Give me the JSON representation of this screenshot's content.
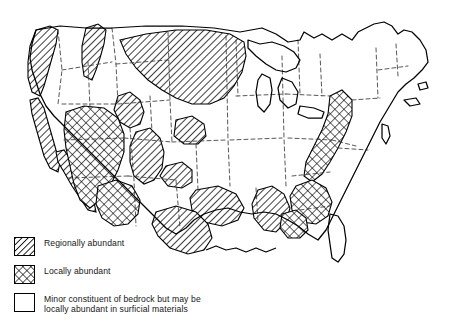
{
  "figure": {
    "kind": "thematic-map",
    "region": "Contiguous United States"
  },
  "legend": {
    "items": [
      {
        "pattern": "diagonal-hatch",
        "label": "Regionally abundant",
        "swatch_name": "legend-swatch-regionally-abundant"
      },
      {
        "pattern": "cross-hatch",
        "label": "Locally abundant",
        "swatch_name": "legend-swatch-locally-abundant"
      },
      {
        "pattern": "blank",
        "label": "Minor constituent of bedrock but may be\nlocally abundant in surficial materials",
        "swatch_name": "legend-swatch-minor-constituent"
      }
    ]
  },
  "colors": {
    "ink": "#000000",
    "background": "#ffffff",
    "state_border": "#3a3a3a",
    "label_text": "#161616"
  },
  "map_regions": {
    "regionally_abundant": [
      "Pacific Northwest / Cascades",
      "Northern Rockies (Idaho, Montana)",
      "Northern Great Plains (Montana, Dakotas, Wyoming)",
      "California Coast Ranges",
      "Colorado Rockies",
      "Central Plains (Kansas, Nebraska patches)",
      "Ozark / Arkansas",
      "Texas Hill Country and Gulf Coastal Plain",
      "Mississippi Embayment"
    ],
    "locally_abundant": [
      "Great Basin (Nevada, Utah)",
      "Arizona / New Mexico Highlands",
      "Appalachian Belt",
      "Southern Piedmont / Georgia",
      "Gulf Coast of Alabama and Mississippi"
    ],
    "minor_constituent": [
      "Upper Midwest and Great Lakes",
      "Northeast / New England",
      "Central Lowlands",
      "Florida Peninsula",
      "Atlantic Coastal Plain"
    ]
  }
}
